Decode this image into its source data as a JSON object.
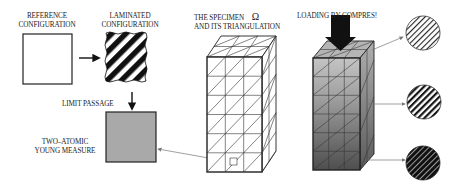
{
  "labels": {
    "reference_line1": "REFERENCE",
    "reference_line2": "CONFIGURATION",
    "laminated_line1": "LAMINATED",
    "laminated_line2": "CONFIGURATION",
    "limit_passage": "LIMIT PASSAGE",
    "young_line1": "TWO–ATOMIC",
    "young_line2": "YOUNG MEASURE",
    "specimen_line1": "THE SPECIMEN",
    "specimen_symbol": "Ω",
    "specimen_line2": "AND ITS TRIANGULATION",
    "loading": "LOADING BY COMPRES!"
  },
  "colors": {
    "ink": "#1a1a1a",
    "young_measure_fill": "#a8a8a8",
    "arrow_line": "#777777",
    "gradient_top": "#bdbdbd",
    "gradient_bottom": "#4a4a4a"
  },
  "microstructure_circles": [
    {
      "name": "top",
      "style": "fine-light"
    },
    {
      "name": "middle",
      "style": "medium"
    },
    {
      "name": "bottom",
      "style": "dark"
    }
  ]
}
